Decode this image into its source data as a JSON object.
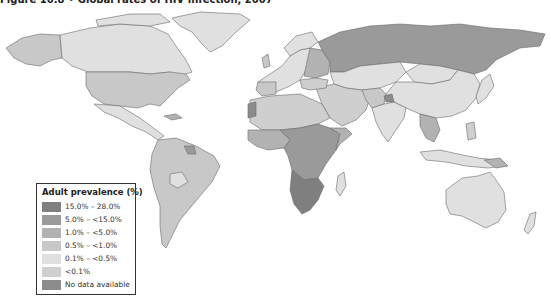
{
  "figure": {
    "title": "Figure 10.8 • Global rates of HIV infection, 2007"
  },
  "legend": {
    "title": "Adult prevalence (%)",
    "items": [
      {
        "label": "15.0% – 28.0%",
        "color": "#7f7f7f"
      },
      {
        "label": "5.0% – <15.0%",
        "color": "#9a9a9a"
      },
      {
        "label": "1.0% – <5.0%",
        "color": "#b2b2b2"
      },
      {
        "label": "0.5% – <1.0%",
        "color": "#c8c8c8"
      },
      {
        "label": "0.1% – <0.5%",
        "color": "#e0e0e0"
      },
      {
        "label": "<0.1%",
        "color": "#cfcfcf"
      },
      {
        "label": "No data available",
        "color": "#8c8c8c"
      }
    ]
  },
  "map": {
    "type": "choropleth",
    "projection": "world",
    "regions": [
      {
        "name": "Southern Africa",
        "class": "15.0% – 28.0%"
      },
      {
        "name": "East & Central Africa",
        "class": "5.0% – <15.0%"
      },
      {
        "name": "West Africa",
        "class": "1.0% – <5.0%"
      },
      {
        "name": "Russia",
        "class": "1.0% – <5.0%"
      },
      {
        "name": "United States",
        "class": "0.5% – <1.0%"
      },
      {
        "name": "Brazil / South America",
        "class": "0.5% – <1.0%"
      },
      {
        "name": "Canada",
        "class": "0.1% – <0.5%"
      },
      {
        "name": "China",
        "class": "0.1% – <0.5%"
      },
      {
        "name": "Australia",
        "class": "0.1% – <0.5%"
      },
      {
        "name": "Greenland",
        "class": "0.1% – <0.5%"
      },
      {
        "name": "Western Europe",
        "class": "0.1% – <0.5%"
      },
      {
        "name": "North Africa / Middle East",
        "class": "<0.1%"
      },
      {
        "name": "India",
        "class": "0.1% – <0.5%"
      },
      {
        "name": "Southeast Asia",
        "class": "1.0% – <5.0%"
      }
    ]
  }
}
